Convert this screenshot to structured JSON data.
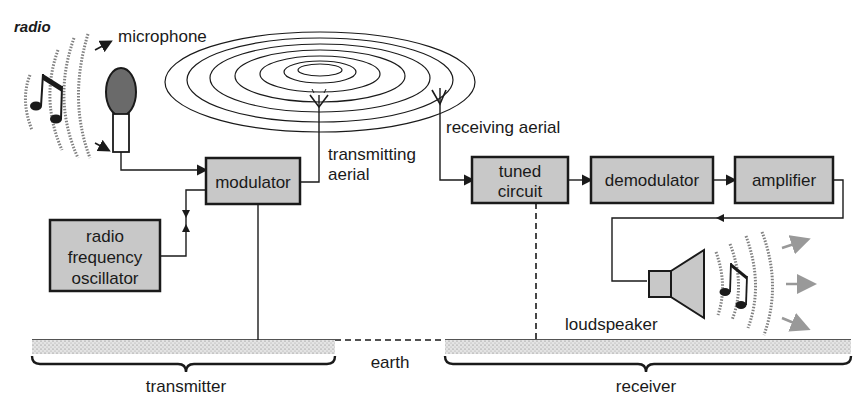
{
  "diagram": {
    "title": "radio",
    "colors": {
      "box_fill": "#c8c8c8",
      "line": "#1a1a1a",
      "sound_arrows": "#999999"
    },
    "labels": {
      "microphone": "microphone",
      "transmitting_aerial_line1": "transmitting",
      "transmitting_aerial_line2": "aerial",
      "receiving_aerial": "receiving aerial",
      "loudspeaker": "loudspeaker",
      "earth": "earth",
      "transmitter": "transmitter",
      "receiver": "receiver"
    },
    "blocks": {
      "modulator": "modulator",
      "oscillator_line1": "radio",
      "oscillator_line2": "frequency",
      "oscillator_line3": "oscillator",
      "tuned_line1": "tuned",
      "tuned_line2": "circuit",
      "demodulator": "demodulator",
      "amplifier": "amplifier"
    },
    "icons": {
      "microphone": "microphone-icon",
      "music_notes": "music-note-icon",
      "aerial": "antenna-icon",
      "loudspeaker": "speaker-icon",
      "radio_waves": "radio-waves-icon"
    }
  }
}
